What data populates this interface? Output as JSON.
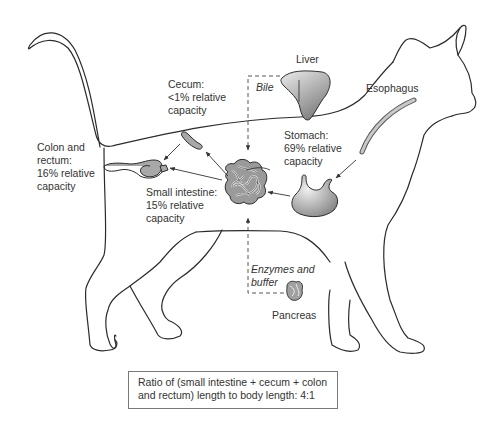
{
  "diagram": {
    "labels": {
      "liver": "Liver",
      "bile": "Bile",
      "esophagus": "Esophagus",
      "cecum": "Cecum:\n<1% relative\ncapacity",
      "stomach": "Stomach:\n69% relative\ncapacity",
      "colon": "Colon and\nrectum:\n16% relative\ncapacity",
      "small_intestine": "Small intestine:\n15% relative\ncapacity",
      "enzymes": "Enzymes and\nbuffer",
      "pancreas": "Pancreas"
    },
    "organs": [
      {
        "name": "Stomach",
        "relative_capacity": "69%"
      },
      {
        "name": "Small intestine",
        "relative_capacity": "15%"
      },
      {
        "name": "Cecum",
        "relative_capacity": "<1%"
      },
      {
        "name": "Colon and rectum",
        "relative_capacity": "16%"
      }
    ],
    "caption": "Ratio of (small intestine + cecum + colon and rectum) length to body length: 4:1",
    "colors": {
      "outline": "#2b2b2b",
      "organ_fill_light": "#e6e6e6",
      "organ_fill_dark": "#8c8c8c",
      "arrow": "#333333"
    }
  }
}
